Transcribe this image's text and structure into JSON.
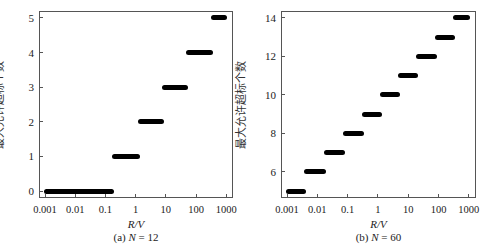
{
  "chart_data": [
    {
      "type": "line",
      "title": "",
      "caption": {
        "prefix": "(a) ",
        "var": "N",
        "rest": " = 12"
      },
      "xlabel": "R/V",
      "ylabel": "最大允许超标个数",
      "xscale": "log",
      "xlim": [
        0.001,
        1000
      ],
      "ylim": [
        -0.2,
        5.2
      ],
      "xticks": [
        "0.001",
        "0.01",
        "0.1",
        "1",
        "10",
        "100",
        "1000"
      ],
      "yticks": [
        "0",
        "1",
        "2",
        "3",
        "4",
        "5"
      ],
      "grid": false,
      "legend": null,
      "series": [
        {
          "name": "step",
          "segments": [
            {
              "y": 0,
              "x_start": 0.001,
              "x_end": 0.18
            },
            {
              "y": 1,
              "x_start": 0.18,
              "x_end": 1.3
            },
            {
              "y": 2,
              "x_start": 1.3,
              "x_end": 8
            },
            {
              "y": 3,
              "x_start": 8,
              "x_end": 50
            },
            {
              "y": 4,
              "x_start": 50,
              "x_end": 350
            },
            {
              "y": 5,
              "x_start": 350,
              "x_end": 1000
            }
          ]
        }
      ]
    },
    {
      "type": "line",
      "title": "",
      "caption": {
        "prefix": "(b) ",
        "var": "N",
        "rest": " = 60"
      },
      "xlabel": "R/V",
      "ylabel": "最大允许超标个数",
      "xscale": "log",
      "xlim": [
        0.001,
        1000
      ],
      "ylim": [
        4.65,
        14.35
      ],
      "xticks": [
        "0.001",
        "0.01",
        "0.1",
        "1",
        "10",
        "100",
        "1000"
      ],
      "yticks": [
        "6",
        "8",
        "10",
        "12",
        "14"
      ],
      "grid": false,
      "legend": null,
      "series": [
        {
          "name": "step",
          "segments": [
            {
              "y": 5,
              "x_start": 0.001,
              "x_end": 0.004
            },
            {
              "y": 6,
              "x_start": 0.004,
              "x_end": 0.018
            },
            {
              "y": 7,
              "x_start": 0.018,
              "x_end": 0.075
            },
            {
              "y": 8,
              "x_start": 0.075,
              "x_end": 0.32
            },
            {
              "y": 9,
              "x_start": 0.32,
              "x_end": 1.3
            },
            {
              "y": 10,
              "x_start": 1.3,
              "x_end": 5
            },
            {
              "y": 11,
              "x_start": 5,
              "x_end": 20
            },
            {
              "y": 12,
              "x_start": 20,
              "x_end": 80
            },
            {
              "y": 13,
              "x_start": 80,
              "x_end": 320
            },
            {
              "y": 14,
              "x_start": 320,
              "x_end": 1000
            }
          ]
        }
      ]
    }
  ]
}
